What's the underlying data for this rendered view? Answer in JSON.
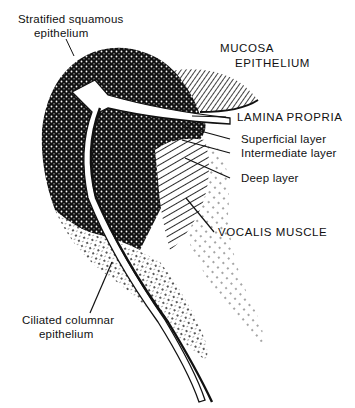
{
  "figure": {
    "type": "anatomical-illustration",
    "background": "#ffffff",
    "ink": "#111111"
  },
  "labels": {
    "stratified_1": "Stratified squamous",
    "stratified_2": "epithelium",
    "mucosa": "MUCOSA",
    "epithelium": "EPITHELIUM",
    "lamina_propria": "LAMINA PROPRIA",
    "superficial": "Superficial layer",
    "intermediate": "Intermediate layer",
    "deep": "Deep layer",
    "vocalis": "VOCALIS MUSCLE",
    "ciliated_1": "Ciliated columnar",
    "ciliated_2": "epithelium"
  }
}
